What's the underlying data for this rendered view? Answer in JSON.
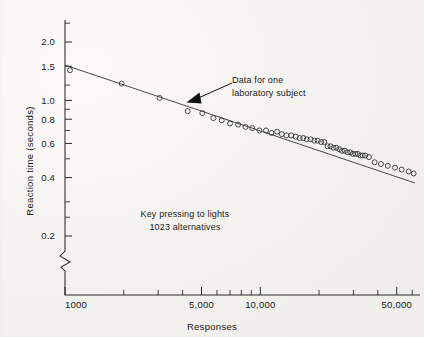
{
  "figure": {
    "background_color": "#f4f3f1",
    "ink_color": "#1b1b1b"
  },
  "annotations": {
    "callout_line1": "Data for one",
    "callout_line2": "laboratory subject",
    "caption_line1": "Key pressing to lights",
    "caption_line2": "1023 alternatives"
  },
  "chart_data": {
    "type": "scatter",
    "title": "",
    "subtitle": "",
    "xlabel": "Responses",
    "ylabel": "Reaction time (seconds)",
    "xscale": "log",
    "yscale": "log",
    "xlim": [
      1000,
      62000
    ],
    "ylim": [
      0.18,
      2.6
    ],
    "grid": false,
    "legend": null,
    "axis_break_y": true,
    "xticks": [
      1000,
      5000,
      10000,
      50000
    ],
    "xtick_labels": [
      "1000",
      "5,000",
      "10,000",
      "50,000"
    ],
    "xticks_minor": [
      2000,
      3000,
      4000,
      6000,
      7000,
      8000,
      9000,
      20000,
      30000,
      40000,
      60000
    ],
    "yticks": [
      2.0,
      1.5,
      1.0,
      0.8,
      0.6,
      0.4,
      0.2
    ],
    "ytick_labels": [
      "2.0",
      "1.5",
      "1.0",
      "0.8",
      "0.6",
      "0.4",
      "0.2"
    ],
    "yticks_minor": [
      2.5,
      1.2,
      0.9,
      0.7,
      0.5,
      0.3,
      0.25
    ],
    "series": [
      {
        "name": "Data for one laboratory subject",
        "marker": "open-circle",
        "x": [
          1060,
          1950,
          3050,
          4250,
          5050,
          5750,
          6350,
          7000,
          7700,
          8400,
          9100,
          9900,
          10700,
          11400,
          12200,
          12900,
          13600,
          14400,
          15200,
          15900,
          16600,
          17300,
          18100,
          18900,
          19700,
          20500,
          21300,
          22100,
          22900,
          23700,
          24500,
          25400,
          26200,
          27100,
          28000,
          28900,
          29800,
          30700,
          31600,
          32500,
          33500,
          34500,
          36000,
          38500,
          41500,
          45000,
          49000,
          53000,
          57500,
          61000
        ],
        "y": [
          1.43,
          1.22,
          1.03,
          0.88,
          0.86,
          0.81,
          0.79,
          0.76,
          0.75,
          0.73,
          0.72,
          0.7,
          0.7,
          0.68,
          0.69,
          0.67,
          0.66,
          0.66,
          0.65,
          0.64,
          0.64,
          0.63,
          0.63,
          0.62,
          0.62,
          0.61,
          0.61,
          0.58,
          0.58,
          0.57,
          0.57,
          0.56,
          0.55,
          0.55,
          0.54,
          0.54,
          0.53,
          0.53,
          0.53,
          0.52,
          0.52,
          0.52,
          0.51,
          0.48,
          0.47,
          0.46,
          0.45,
          0.44,
          0.43,
          0.42
        ]
      }
    ],
    "fit_line": {
      "name": "fitted power law",
      "x": [
        1000,
        62000
      ],
      "y": [
        1.52,
        0.375
      ]
    }
  }
}
